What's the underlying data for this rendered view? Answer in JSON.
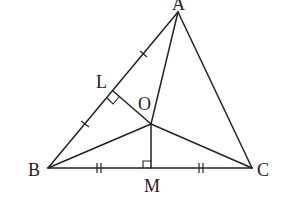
{
  "diagram": {
    "type": "geometry",
    "points": {
      "A": {
        "label": "A",
        "x": 178,
        "y": 12
      },
      "B": {
        "label": "B",
        "x": 48,
        "y": 168
      },
      "C": {
        "label": "C",
        "x": 252,
        "y": 168
      },
      "O": {
        "label": "O",
        "x": 151,
        "y": 124
      },
      "L": {
        "label": "L",
        "x": 113,
        "y": 90
      },
      "M": {
        "label": "M",
        "x": 151,
        "y": 168
      }
    },
    "segments": [
      "AB",
      "BC",
      "CA",
      "OA",
      "OB",
      "OC",
      "OL",
      "OM"
    ],
    "right_angles": [
      "OLA at L",
      "OMC at M"
    ],
    "equal_marks": {
      "single_tick": [
        "BL",
        "LA"
      ],
      "double_tick": [
        "BM",
        "MC"
      ]
    }
  }
}
